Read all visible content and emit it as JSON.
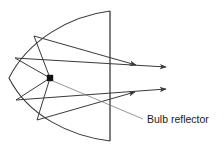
{
  "figure": {
    "background_color": "#ffffff",
    "stroke_color": "#3a3a3a",
    "label_color": "#1a1a1a",
    "width": 224,
    "height": 151
  },
  "labels": {
    "bulb_reflector": "Bulb reflector"
  },
  "annotations": {
    "leader_line": {
      "from_x": 52,
      "from_y": 80,
      "to_x": 143,
      "to_y": 119
    },
    "label_position": {
      "x": 147,
      "y": 120
    }
  },
  "geometry": {
    "reflector_type": "parabola",
    "focus": {
      "x": 50,
      "y": 78,
      "size": 6,
      "color": "#111111"
    },
    "vertex": {
      "x": 9,
      "y": 78
    },
    "aperture_line": {
      "x": 110,
      "y_top": 11,
      "y_bottom": 141
    },
    "parabola_path": "M 110 11 C 70 16 28 40 9 78 C 28 116 70 136 110 141",
    "incident_rays": [
      {
        "x1": 50,
        "y1": 78,
        "x2": 34,
        "y2": 36
      },
      {
        "x1": 50,
        "y1": 78,
        "x2": 15,
        "y2": 58
      },
      {
        "x1": 50,
        "y1": 78,
        "x2": 16,
        "y2": 100
      },
      {
        "x1": 50,
        "y1": 78,
        "x2": 37,
        "y2": 120
      }
    ],
    "reflected_rays": [
      {
        "x1": 34,
        "y1": 36,
        "x2": 138,
        "y2": 65,
        "arrow": true
      },
      {
        "x1": 15,
        "y1": 58,
        "x2": 168,
        "y2": 67,
        "arrow": true
      },
      {
        "x1": 16,
        "y1": 100,
        "x2": 168,
        "y2": 89,
        "arrow": true
      },
      {
        "x1": 37,
        "y1": 120,
        "x2": 137,
        "y2": 92,
        "arrow": true
      }
    ],
    "arrow_count": 4
  }
}
